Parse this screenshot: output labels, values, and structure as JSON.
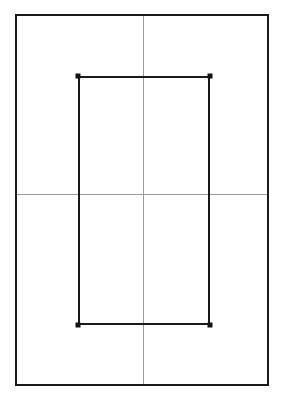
{
  "canvas": {
    "width": 282,
    "height": 402,
    "background": "#ffffff",
    "title": "Nested rectangles with center crosshair"
  },
  "colors": {
    "outline": "#1a1a1a",
    "guide": "#9a9a9a",
    "vertex": "#111111",
    "background": "#ffffff"
  },
  "shapes": {
    "outer_rectangle": {
      "label": "outer-frame",
      "x": 15,
      "y": 14,
      "width": 254,
      "height": 372,
      "right": 269,
      "bottom": 386,
      "stroke": "#1a1a1a",
      "stroke_width": 2,
      "fill": "none"
    },
    "inner_rectangle": {
      "label": "inner-frame",
      "x": 78,
      "y": 76,
      "width": 132,
      "height": 249,
      "right": 210,
      "bottom": 325,
      "stroke": "#1a1a1a",
      "stroke_width": 2,
      "fill": "none"
    },
    "vertical_guide": {
      "label": "vertical-center-line",
      "x1": 143,
      "y1": 14,
      "x2": 143,
      "y2": 386,
      "stroke": "#9a9a9a",
      "stroke_width": 1
    },
    "horizontal_guide": {
      "label": "horizontal-center-line",
      "x1": 15,
      "y1": 194,
      "x2": 269,
      "y2": 194,
      "stroke": "#9a9a9a",
      "stroke_width": 1
    }
  },
  "vertices": [
    {
      "name": "inner-top-left",
      "cx": 78,
      "cy": 76,
      "size": 5
    },
    {
      "name": "inner-top-right",
      "cx": 210,
      "cy": 76,
      "size": 5
    },
    {
      "name": "inner-bottom-left",
      "cx": 78,
      "cy": 325,
      "size": 5
    },
    {
      "name": "inner-bottom-right",
      "cx": 210,
      "cy": 325,
      "size": 5
    }
  ],
  "chart_data": {
    "type": "scatter",
    "title": "",
    "xlabel": "",
    "ylabel": "",
    "xlim": [
      15,
      269
    ],
    "ylim": [
      14,
      386
    ],
    "grid": true,
    "legend": null,
    "annotations": [
      "Outer bounding rectangle spanning x 15-269, y 14-386",
      "Center crosshair guides at x = 143 and y = 194",
      "Inner rectangle spanning x 78-210, y 76-325 with marked corner vertices"
    ],
    "series": [
      {
        "name": "inner-rectangle-vertices",
        "x": [
          78,
          210,
          210,
          78
        ],
        "y": [
          76,
          76,
          325,
          325
        ]
      }
    ]
  }
}
